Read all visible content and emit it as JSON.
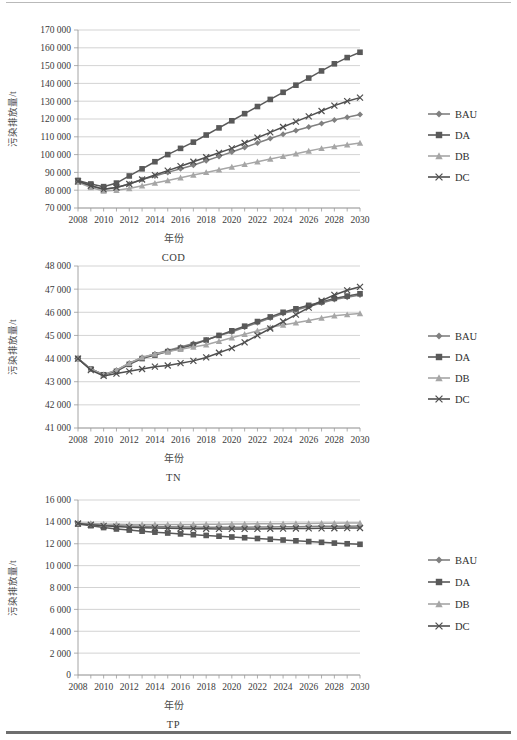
{
  "page": {
    "ylabel": "污染排放量/t",
    "xlabel": "年份",
    "legend_labels": [
      "BAU",
      "DA",
      "DB",
      "DC"
    ],
    "series_colors": {
      "BAU": "#808080",
      "DA": "#595959",
      "DB": "#a6a6a6",
      "DC": "#4f4f4f"
    },
    "markers": {
      "BAU": "diamond",
      "DA": "square",
      "DB": "triangle",
      "DC": "x"
    }
  },
  "charts": [
    {
      "id": "cod",
      "title": "COD",
      "chart_data": {
        "type": "line",
        "title": "COD",
        "xlabel": "年份",
        "ylabel": "污染排放量/t",
        "grid": true,
        "legend_position": "right",
        "ylim": [
          70000,
          170000
        ],
        "ytick_labels": [
          "70 000",
          "80 000",
          "90 000",
          "100 000",
          "110 000",
          "120 000",
          "130 000",
          "140 000",
          "150 000",
          "160 000",
          "170 000"
        ],
        "yticks": [
          70000,
          80000,
          90000,
          100000,
          110000,
          120000,
          130000,
          140000,
          150000,
          160000,
          170000
        ],
        "x": [
          2008,
          2009,
          2010,
          2011,
          2012,
          2013,
          2014,
          2015,
          2016,
          2017,
          2018,
          2019,
          2020,
          2021,
          2022,
          2023,
          2024,
          2025,
          2026,
          2027,
          2028,
          2029,
          2030
        ],
        "xtick_labels": [
          "2008",
          "2010",
          "2012",
          "2014",
          "2016",
          "2018",
          "2020",
          "2022",
          "2024",
          "2026",
          "2028",
          "2030"
        ],
        "series": [
          {
            "name": "BAU",
            "values": [
              85000,
              82500,
              80500,
              81500,
              83500,
              86000,
              88000,
              90000,
              92000,
              94000,
              96500,
              99000,
              101500,
              104000,
              106500,
              109000,
              111500,
              113500,
              115500,
              117500,
              119500,
              121000,
              122500
            ]
          },
          {
            "name": "DA",
            "values": [
              85500,
              83500,
              82000,
              84000,
              88000,
              92000,
              96000,
              100000,
              103500,
              107000,
              111000,
              115000,
              119000,
              123000,
              127000,
              131000,
              135000,
              139000,
              143000,
              147000,
              151000,
              154500,
              157500
            ]
          },
          {
            "name": "DB",
            "values": [
              84500,
              81500,
              79500,
              80000,
              81000,
              82500,
              84000,
              85500,
              87000,
              88500,
              90000,
              91500,
              93000,
              94500,
              96000,
              97500,
              99000,
              100500,
              102000,
              103500,
              104500,
              105500,
              106500
            ]
          },
          {
            "name": "DC",
            "values": [
              85000,
              82500,
              80500,
              81500,
              83500,
              86000,
              88500,
              91000,
              93500,
              96000,
              98500,
              101000,
              103500,
              106500,
              109500,
              112500,
              115500,
              118500,
              121500,
              124500,
              127500,
              130000,
              132000
            ]
          }
        ]
      }
    },
    {
      "id": "tn",
      "title": "TN",
      "chart_data": {
        "type": "line",
        "title": "TN",
        "xlabel": "年份",
        "ylabel": "污染排放量/t",
        "grid": true,
        "legend_position": "right",
        "ylim": [
          41000,
          48000
        ],
        "ytick_labels": [
          "41 000",
          "42 000",
          "43 000",
          "44 000",
          "45 000",
          "46 000",
          "47 000",
          "48 000"
        ],
        "yticks": [
          41000,
          42000,
          43000,
          44000,
          45000,
          46000,
          47000,
          48000
        ],
        "x": [
          2008,
          2009,
          2010,
          2011,
          2012,
          2013,
          2014,
          2015,
          2016,
          2017,
          2018,
          2019,
          2020,
          2021,
          2022,
          2023,
          2024,
          2025,
          2026,
          2027,
          2028,
          2029,
          2030
        ],
        "xtick_labels": [
          "2008",
          "2010",
          "2012",
          "2014",
          "2016",
          "2018",
          "2020",
          "2022",
          "2024",
          "2026",
          "2028",
          "2030"
        ],
        "series": [
          {
            "name": "BAU",
            "values": [
              44000,
              43550,
              43300,
              43500,
              43800,
              44050,
              44200,
              44350,
              44500,
              44650,
              44800,
              45000,
              45150,
              45350,
              45550,
              45750,
              45950,
              46100,
              46250,
              46400,
              46550,
              46650,
              46750
            ]
          },
          {
            "name": "DA",
            "values": [
              44000,
              43550,
              43300,
              43450,
              43750,
              44000,
              44150,
              44300,
              44450,
              44600,
              44800,
              45000,
              45200,
              45400,
              45600,
              45800,
              46000,
              46150,
              46300,
              46450,
              46600,
              46700,
              46800
            ]
          },
          {
            "name": "DB",
            "values": [
              44000,
              43550,
              43300,
              43500,
              43800,
              44050,
              44200,
              44300,
              44400,
              44500,
              44600,
              44750,
              44900,
              45050,
              45200,
              45350,
              45450,
              45550,
              45650,
              45750,
              45850,
              45900,
              45950
            ]
          },
          {
            "name": "DC",
            "values": [
              44000,
              43500,
              43250,
              43350,
              43450,
              43550,
              43650,
              43700,
              43800,
              43900,
              44050,
              44250,
              44450,
              44700,
              45000,
              45300,
              45600,
              45900,
              46200,
              46500,
              46750,
              46950,
              47100
            ]
          }
        ]
      }
    },
    {
      "id": "tp",
      "title": "TP",
      "chart_data": {
        "type": "line",
        "title": "TP",
        "xlabel": "年份",
        "ylabel": "污染排放量/t",
        "grid": true,
        "legend_position": "right",
        "ylim": [
          0,
          16000
        ],
        "ytick_labels": [
          "0",
          "2 000",
          "4 000",
          "6 000",
          "8 000",
          "10 000",
          "12 000",
          "14 000",
          "16 000"
        ],
        "yticks": [
          0,
          2000,
          4000,
          6000,
          8000,
          10000,
          12000,
          14000,
          16000
        ],
        "x": [
          2008,
          2009,
          2010,
          2011,
          2012,
          2013,
          2014,
          2015,
          2016,
          2017,
          2018,
          2019,
          2020,
          2021,
          2022,
          2023,
          2024,
          2025,
          2026,
          2027,
          2028,
          2029,
          2030
        ],
        "xtick_labels": [
          "2008",
          "2010",
          "2012",
          "2014",
          "2016",
          "2018",
          "2020",
          "2022",
          "2024",
          "2026",
          "2028",
          "2030"
        ],
        "series": [
          {
            "name": "BAU",
            "values": [
              13850,
              13780,
              13700,
              13650,
              13620,
              13590,
              13570,
              13550,
              13540,
              13530,
              13520,
              13520,
              13520,
              13520,
              13530,
              13540,
              13550,
              13560,
              13570,
              13590,
              13600,
              13610,
              13620
            ]
          },
          {
            "name": "DA",
            "values": [
              13800,
              13650,
              13480,
              13350,
              13250,
              13150,
              13060,
              12980,
              12900,
              12830,
              12760,
              12690,
              12620,
              12550,
              12480,
              12410,
              12340,
              12270,
              12200,
              12130,
              12060,
              12000,
              11950
            ]
          },
          {
            "name": "DB",
            "values": [
              13900,
              13850,
              13800,
              13780,
              13770,
              13760,
              13760,
              13760,
              13760,
              13770,
              13780,
              13790,
              13800,
              13810,
              13820,
              13830,
              13840,
              13850,
              13860,
              13870,
              13880,
              13890,
              13900
            ]
          },
          {
            "name": "DC",
            "values": [
              13850,
              13740,
              13640,
              13570,
              13520,
              13470,
              13440,
              13410,
              13390,
              13380,
              13370,
              13360,
              13360,
              13360,
              13360,
              13370,
              13380,
              13390,
              13400,
              13410,
              13420,
              13430,
              13440
            ]
          }
        ]
      }
    }
  ]
}
